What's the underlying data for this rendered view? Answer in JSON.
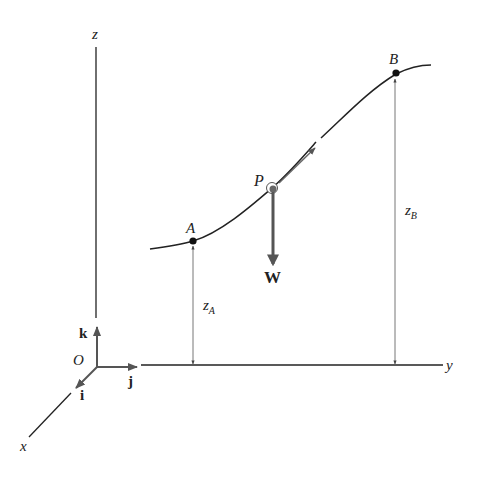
{
  "figure": {
    "axes": {
      "z_label": "z",
      "y_label": "y",
      "x_label": "x",
      "origin_label": "O",
      "unit_vectors": {
        "i": "i",
        "j": "j",
        "k": "k"
      }
    },
    "points": {
      "A": "A",
      "B": "B",
      "P": "P"
    },
    "force": {
      "label": "W"
    },
    "dimensions": {
      "zA": {
        "base": "z",
        "sub": "A"
      },
      "zB": {
        "base": "z",
        "sub": "B"
      }
    },
    "colors": {
      "line": "#222222",
      "vector": "#555555",
      "dimension": "#777777"
    }
  }
}
